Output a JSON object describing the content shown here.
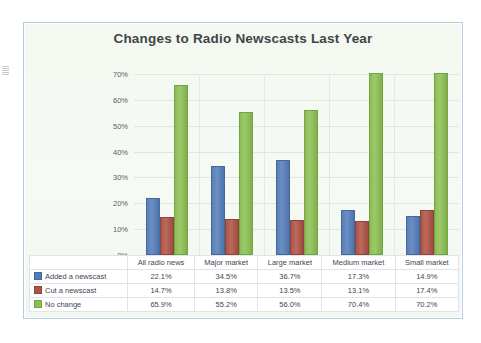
{
  "chart_data": {
    "type": "bar",
    "title": "Changes to Radio Newscasts Last Year",
    "xlabel": "",
    "ylabel": "",
    "ylim": [
      0,
      70
    ],
    "ytick_values": [
      0,
      10,
      20,
      30,
      40,
      50,
      60,
      70
    ],
    "ytick_labels": [
      "0%",
      "10%",
      "20%",
      "30%",
      "40%",
      "50%",
      "60%",
      "70%"
    ],
    "grid": true,
    "legend_position": "data-table-below",
    "categories": [
      "All radio news",
      "Major market",
      "Large market",
      "Medium market",
      "Small market"
    ],
    "series": [
      {
        "name": "Added a newscast",
        "color": "#4f7cb4",
        "values": [
          22.1,
          34.5,
          36.7,
          17.3,
          14.9
        ],
        "labels": [
          "22.1%",
          "34.5%",
          "36.7%",
          "17.3%",
          "14.9%"
        ]
      },
      {
        "name": "Cut a newscast",
        "color": "#a9564b",
        "values": [
          14.7,
          13.8,
          13.5,
          13.1,
          17.4
        ],
        "labels": [
          "14.7%",
          "13.8%",
          "13.5%",
          "13.1%",
          "17.4%"
        ]
      },
      {
        "name": "No change",
        "color": "#8cbd57",
        "values": [
          65.9,
          55.2,
          56.0,
          70.4,
          70.2
        ],
        "labels": [
          "65.9%",
          "55.2%",
          "56.0%",
          "70.4%",
          "70.2%"
        ]
      }
    ]
  },
  "colors": {
    "series_1": "#4f7cb4",
    "series_2": "#a9564b",
    "series_3": "#8cbd57",
    "frame_border": "#b7cde4",
    "plot_background": "#f4f8f2",
    "gridline": "#dfe5e2",
    "title_text": "#3f4548"
  }
}
